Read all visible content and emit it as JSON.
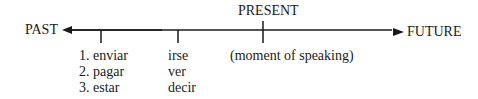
{
  "timeline": {
    "left_label": "PAST",
    "right_label": "FUTURE",
    "present_label": "PRESENT",
    "present_note": "(moment of speaking)",
    "line_color": "#1a1a1a"
  },
  "columns": [
    {
      "items": [
        "1. enviar",
        "2. pagar",
        "3. estar"
      ]
    },
    {
      "items": [
        "irse",
        "ver",
        "decir"
      ]
    }
  ]
}
